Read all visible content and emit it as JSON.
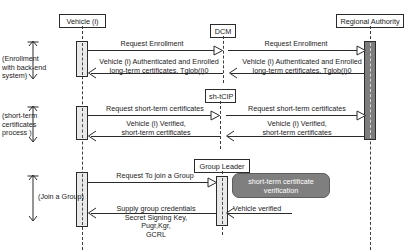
{
  "diagram": {
    "type": "uml-sequence-diagram",
    "colors": {
      "line": "#2b2b2b",
      "activation_fill": "#e9e9e9",
      "activation_dark_fill": "#7d7d7d",
      "callout_fill": "#7f7f7f",
      "callout_text": "#ffffff",
      "background": "#ffffff"
    }
  },
  "lifelines": [
    {
      "id": "vehicle",
      "label": "Vehicle (i)"
    },
    {
      "id": "dcm",
      "label": "DCM"
    },
    {
      "id": "shtcip",
      "label": "sh-tCIP"
    },
    {
      "id": "group_leader",
      "label": "Group Leader"
    },
    {
      "id": "regional_authority",
      "label": "Regional Authority"
    }
  ],
  "phases": [
    {
      "id": "phase-enrollment",
      "label_lines": [
        "(Enrollment",
        "with back-end",
        "system)"
      ]
    },
    {
      "id": "phase-short-term",
      "label_lines": [
        "(short-term",
        "certificates",
        "process )"
      ]
    },
    {
      "id": "phase-join-group",
      "label_lines": [
        "(Join a Group)"
      ]
    }
  ],
  "messages": {
    "m1": {
      "lines": [
        "Request Enrollment"
      ]
    },
    "m2": {
      "lines": [
        "Request Enrollment"
      ]
    },
    "m3": {
      "lines": [
        "Vehicle (i) Authenticated and Enrolled",
        "long-term certificates, Tglob(i)0"
      ]
    },
    "m4": {
      "lines": [
        "Vehicle (i) Authenticated and Enrolled",
        "long-term certificates, Tglob(i)0"
      ]
    },
    "m5": {
      "lines": [
        "Request short-term certificates"
      ]
    },
    "m6": {
      "lines": [
        "Request short-term certificates"
      ]
    },
    "m7": {
      "lines": [
        "Vehicle (i) Verified,",
        "short-term certificates"
      ]
    },
    "m8": {
      "lines": [
        "Vehicle (i) Verified,",
        "short-term certificates"
      ]
    },
    "m9": {
      "lines": [
        "Request To join a Group"
      ]
    },
    "m10": {
      "lines": [
        "Supply group credentials",
        "Secret Signing Key,",
        "Pugr,Kgr,",
        "GCRL"
      ]
    },
    "m11": {
      "lines": [
        "Vehicle verified"
      ]
    }
  },
  "callout": {
    "lines": [
      "short-term certificate",
      "verification"
    ]
  }
}
